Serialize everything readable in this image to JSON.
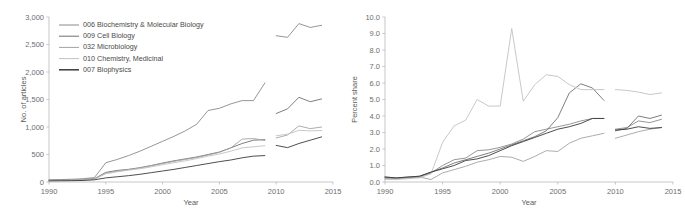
{
  "figure": {
    "panels": [
      "left",
      "right"
    ]
  },
  "legend": {
    "items": [
      {
        "label": "006 Biochemistry & Molecular Biology",
        "color": "#8a8a8a"
      },
      {
        "label": "009 Cell Biology",
        "color": "#6f6f6f"
      },
      {
        "label": "032 Microbiology",
        "color": "#a3a3a3"
      },
      {
        "label": "010 Chemistry, Medicinal",
        "color": "#c2c2c2"
      },
      {
        "label": "007 Biophysics",
        "color": "#3a3a3a"
      }
    ]
  },
  "chart_data": [
    {
      "type": "line",
      "title": "",
      "panel": "left",
      "xlabel": "Year",
      "ylabel": "No. of articles",
      "xlim": [
        1990,
        2015
      ],
      "ylim": [
        0,
        3000
      ],
      "xticks": [
        1990,
        1995,
        2000,
        2005,
        2010,
        2015
      ],
      "yticks": [
        0,
        500,
        1000,
        1500,
        2000,
        2500,
        3000
      ],
      "ytick_labels": [
        "0",
        "500",
        "1,000",
        "1,500",
        "2,000",
        "2,500",
        "3,000"
      ],
      "grid": false,
      "legend_position": "top-left",
      "x_segment_1": [
        1990,
        1991,
        1992,
        1993,
        1994,
        1995,
        1996,
        1997,
        1998,
        1999,
        2000,
        2001,
        2002,
        2003,
        2004,
        2005,
        2006,
        2007,
        2008,
        2009
      ],
      "x_segment_2": [
        2010,
        2011,
        2012,
        2013,
        2014
      ],
      "series": [
        {
          "name": "006 Biochemistry & Molecular Biology",
          "color": "#8a8a8a",
          "values_segment_1": [
            40,
            45,
            50,
            60,
            80,
            350,
            410,
            480,
            560,
            650,
            740,
            830,
            930,
            1050,
            1300,
            1340,
            1420,
            1480,
            1480,
            1800
          ],
          "values_segment_2": [
            2660,
            2630,
            2880,
            2810,
            2850
          ]
        },
        {
          "name": "009 Cell Biology",
          "color": "#6f6f6f",
          "values_segment_1": [
            30,
            33,
            36,
            42,
            60,
            175,
            210,
            230,
            260,
            300,
            345,
            385,
            420,
            455,
            500,
            545,
            620,
            700,
            760,
            770
          ],
          "values_segment_2": [
            1245,
            1330,
            1540,
            1460,
            1510
          ]
        },
        {
          "name": "032 Microbiology",
          "color": "#a3a3a3",
          "values_segment_1": [
            28,
            30,
            34,
            40,
            55,
            160,
            195,
            225,
            255,
            295,
            335,
            375,
            410,
            445,
            490,
            540,
            620,
            780,
            790,
            755
          ],
          "values_segment_2": [
            800,
            855,
            1020,
            970,
            1000
          ]
        },
        {
          "name": "010 Chemistry, Medicinal",
          "color": "#c2c2c2",
          "values_segment_1": [
            25,
            27,
            30,
            36,
            50,
            150,
            185,
            215,
            240,
            275,
            315,
            350,
            385,
            425,
            470,
            510,
            560,
            620,
            640,
            660
          ],
          "values_segment_2": [
            840,
            870,
            940,
            930,
            935
          ]
        },
        {
          "name": "007 Biophysics",
          "color": "#3a3a3a",
          "values_segment_1": [
            20,
            22,
            24,
            28,
            40,
            75,
            95,
            115,
            140,
            170,
            200,
            230,
            265,
            300,
            335,
            370,
            400,
            440,
            470,
            480
          ],
          "values_segment_2": [
            665,
            625,
            700,
            760,
            820
          ]
        }
      ]
    },
    {
      "type": "line",
      "title": "",
      "panel": "right",
      "xlabel": "Year",
      "ylabel": "Percent share",
      "xlim": [
        1990,
        2015
      ],
      "ylim": [
        0,
        10
      ],
      "xticks": [
        1990,
        1995,
        2000,
        2005,
        2010,
        2015
      ],
      "yticks": [
        0,
        1,
        2,
        3,
        4,
        5,
        6,
        7,
        8,
        9,
        10
      ],
      "ytick_labels": [
        "0.0",
        "1.0",
        "2.0",
        "3.0",
        "4.0",
        "5.0",
        "6.0",
        "7.0",
        "8.0",
        "9.0",
        "10.0"
      ],
      "grid": false,
      "legend_position": "none",
      "x_segment_1": [
        1990,
        1991,
        1992,
        1993,
        1994,
        1995,
        1996,
        1997,
        1998,
        1999,
        2000,
        2001,
        2002,
        2003,
        2004,
        2005,
        2006,
        2007,
        2008,
        2009
      ],
      "x_segment_2": [
        2010,
        2011,
        2012,
        2013,
        2014
      ],
      "series": [
        {
          "name": "006 Biochemistry & Molecular Biology",
          "color": "#8a8a8a",
          "values_segment_1": [
            0.25,
            0.2,
            0.25,
            0.3,
            0.55,
            1.0,
            1.35,
            1.45,
            1.9,
            1.95,
            2.1,
            2.3,
            2.6,
            3.05,
            3.2,
            3.35,
            3.5,
            3.7,
            3.85,
            3.85
          ],
          "values_segment_2": [
            3.2,
            3.3,
            3.7,
            3.6,
            3.8
          ]
        },
        {
          "name": "009 Cell Biology",
          "color": "#6f6f6f",
          "values_segment_1": [
            0.3,
            0.25,
            0.3,
            0.35,
            0.6,
            0.85,
            1.15,
            1.35,
            1.55,
            1.75,
            2.0,
            2.25,
            2.5,
            2.75,
            3.1,
            3.9,
            5.4,
            5.95,
            5.7,
            4.95
          ],
          "values_segment_2": [
            3.1,
            3.25,
            4.0,
            3.85,
            4.05
          ]
        },
        {
          "name": "032 Microbiology",
          "color": "#a3a3a3",
          "values_segment_1": [
            0.2,
            0.2,
            0.25,
            0.3,
            0.15,
            0.55,
            0.75,
            0.95,
            1.2,
            1.35,
            1.55,
            1.5,
            1.25,
            1.55,
            1.9,
            1.85,
            2.35,
            2.65,
            2.8,
            2.95
          ],
          "values_segment_2": [
            2.65,
            2.85,
            3.05,
            3.2,
            3.3
          ]
        },
        {
          "name": "010 Chemistry, Medicinal",
          "color": "#c2c2c2",
          "values_segment_1": [
            0.15,
            0.15,
            0.2,
            0.25,
            0.5,
            2.4,
            3.4,
            3.75,
            5.0,
            4.6,
            4.6,
            9.3,
            4.9,
            5.9,
            6.5,
            6.4,
            5.9,
            5.6,
            5.6,
            5.6
          ],
          "values_segment_2": [
            5.6,
            5.55,
            5.45,
            5.3,
            5.4
          ]
        },
        {
          "name": "007 Biophysics",
          "color": "#3a3a3a",
          "values_segment_1": [
            0.3,
            0.25,
            0.3,
            0.35,
            0.6,
            0.8,
            1.0,
            1.3,
            1.4,
            1.6,
            1.9,
            2.2,
            2.45,
            2.7,
            2.95,
            3.2,
            3.35,
            3.55,
            3.85,
            3.85
          ],
          "values_segment_2": [
            3.15,
            3.2,
            3.35,
            3.25,
            3.3
          ]
        }
      ]
    }
  ]
}
